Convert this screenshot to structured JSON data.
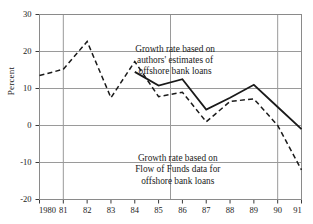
{
  "chart_data": {
    "type": "line",
    "title": "",
    "subtitle": "",
    "xlabel": "",
    "ylabel": "Percent",
    "xlim": [
      1980,
      1991
    ],
    "ylim": [
      -20,
      30
    ],
    "yticks": [
      30,
      20,
      10,
      0,
      -10,
      -20
    ],
    "ytick_labels": [
      "30",
      "20",
      "10",
      "0",
      "-10",
      "-20"
    ],
    "xticks": [
      1980,
      1981,
      1982,
      1983,
      1984,
      1985,
      1986,
      1987,
      1988,
      1989,
      1990,
      1991
    ],
    "xtick_labels": [
      "1980",
      "81",
      "82",
      "83",
      "84",
      "85",
      "86",
      "87",
      "88",
      "89",
      "90",
      "91"
    ],
    "grid": true,
    "grid_axis": "both",
    "legend": "annotations",
    "legend_position": "inside",
    "series": [
      {
        "name": "Growth rate based on authors' estimates of offshore bank loans",
        "style": "solid",
        "color": "#1a1a1a",
        "x": [
          1984,
          1985,
          1986,
          1987,
          1988,
          1989,
          1990,
          1991
        ],
        "values": [
          14.5,
          10.8,
          12.5,
          4.3,
          7.5,
          11.0,
          5.0,
          -1.0
        ]
      },
      {
        "name": "Growth rate based on Flow of Funds data for offshore bank loans",
        "style": "dashed",
        "color": "#1a1a1a",
        "x": [
          1980,
          1981,
          1982,
          1983,
          1984,
          1985,
          1986,
          1987,
          1988,
          1989,
          1990,
          1991
        ],
        "values": [
          13.5,
          15.2,
          22.7,
          7.5,
          17.3,
          7.8,
          9.0,
          1.0,
          6.5,
          7.2,
          0.0,
          -12.0
        ]
      }
    ],
    "annotations": [
      {
        "id": "annotation-authors-estimates",
        "lines": [
          "Growth rate based on",
          "authors' estimates of",
          "offshore bank loans"
        ],
        "x": 1986.2,
        "y": 20.5
      },
      {
        "id": "annotation-flow-of-funds",
        "lines": [
          "Growth rate based on",
          "Flow of Funds data for",
          "offshore bank loans"
        ],
        "x": 1986.2,
        "y": -9.0
      }
    ]
  }
}
